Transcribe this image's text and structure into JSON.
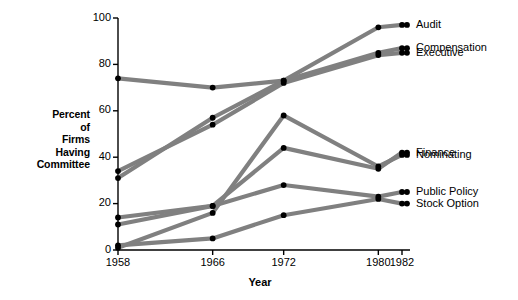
{
  "chart_data": {
    "type": "line",
    "title": "",
    "xlabel": "Year",
    "ylabel": "Percent of Firms Having Committee",
    "ylabel_lines": [
      "Percent",
      "of",
      "Firms",
      "Having",
      "Committee"
    ],
    "x": [
      1958,
      1966,
      1972,
      1980,
      1982
    ],
    "xtick_labels": [
      "1958",
      "1966",
      "1972",
      "1980",
      "1982"
    ],
    "ytick_labels": [
      "0",
      "20",
      "40",
      "60",
      "80",
      "100"
    ],
    "yticks": [
      0,
      20,
      40,
      60,
      80,
      100
    ],
    "ylim": [
      0,
      100
    ],
    "xlim": [
      1958,
      1982
    ],
    "grid": false,
    "legend_position": "right-inline-labels",
    "line_color": "#808080",
    "marker_color": "#000000",
    "axis_color": "#000000",
    "series": [
      {
        "name": "Audit",
        "values": [
          74,
          70,
          73,
          96,
          97
        ]
      },
      {
        "name": "Compensation",
        "values": [
          31,
          57,
          73,
          85,
          87
        ]
      },
      {
        "name": "Executive",
        "values": [
          34,
          54,
          72,
          84,
          85
        ]
      },
      {
        "name": "Nominating",
        "values": [
          1,
          16,
          58,
          36,
          41
        ]
      },
      {
        "name": "Finance",
        "values": [
          11,
          19,
          44,
          35,
          42
        ]
      },
      {
        "name": "Public Policy",
        "values": [
          14,
          19,
          28,
          23,
          25
        ]
      },
      {
        "name": "Stock Option",
        "values": [
          2,
          5,
          15,
          22,
          20
        ]
      }
    ],
    "series_labels": [
      {
        "label": "Audit",
        "value_1982": 97
      },
      {
        "label": "Compensation",
        "value_1982": 87
      },
      {
        "label": "Executive",
        "value_1982": 85
      },
      {
        "label": "Nominating",
        "value_1982": 41
      },
      {
        "label": "Finance",
        "value_1982": 42
      },
      {
        "label": "Public Policy",
        "value_1982": 25
      },
      {
        "label": "Stock Option",
        "value_1982": 20
      }
    ]
  }
}
